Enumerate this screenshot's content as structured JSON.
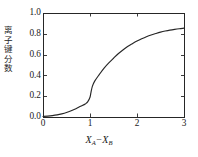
{
  "chart_data": {
    "type": "line",
    "title": "",
    "xlabel": "X_A - X_B",
    "ylabel": "离子键分数",
    "xlim": [
      0,
      3
    ],
    "ylim": [
      0,
      1.0
    ],
    "xticks": [
      "0",
      "1",
      "2",
      "3"
    ],
    "xtick_values": [
      0,
      1,
      2,
      3
    ],
    "yticks": [
      "0.0",
      "0.2",
      "0.4",
      "0.6",
      "0.8",
      "1.0"
    ],
    "ytick_values": [
      0.0,
      0.2,
      0.4,
      0.6,
      0.8,
      1.0
    ],
    "grid": false,
    "legend": "none",
    "series": [
      {
        "name": "ionic bond fraction",
        "color": "#262626",
        "x": [
          0.0,
          0.1,
          0.2,
          0.3,
          0.4,
          0.5,
          0.6,
          0.7,
          0.8,
          0.9,
          0.95,
          1.0,
          1.02,
          1.05,
          1.1,
          1.2,
          1.3,
          1.4,
          1.5,
          1.6,
          1.7,
          1.8,
          1.9,
          2.0,
          2.1,
          2.2,
          2.3,
          2.4,
          2.5,
          2.6,
          2.7,
          2.8,
          2.9,
          3.0
        ],
        "y": [
          0.005,
          0.008,
          0.013,
          0.02,
          0.03,
          0.043,
          0.06,
          0.08,
          0.103,
          0.126,
          0.145,
          0.19,
          0.235,
          0.295,
          0.345,
          0.41,
          0.47,
          0.52,
          0.565,
          0.608,
          0.645,
          0.678,
          0.705,
          0.73,
          0.752,
          0.772,
          0.789,
          0.803,
          0.816,
          0.827,
          0.836,
          0.843,
          0.849,
          0.854
        ]
      }
    ]
  },
  "axis": {
    "ylabel_text": "离\n子\n键\n分\n数",
    "xlabel_var1": "X",
    "xlabel_sub1": "A",
    "xlabel_minus": "−",
    "xlabel_var2": "X",
    "xlabel_sub2": "B"
  },
  "style": {
    "frame_color": "#262626",
    "curve_color": "#262626",
    "background": "#ffffff",
    "text_color": "#1a1a1a"
  },
  "geometry": {
    "plot_left": 43,
    "plot_right": 184,
    "plot_top": 13,
    "plot_bottom": 117
  }
}
